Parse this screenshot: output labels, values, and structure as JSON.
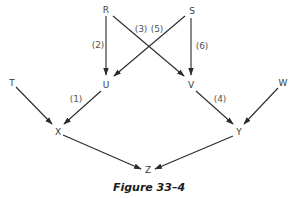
{
  "figure": {
    "caption": "Figure 33–4"
  },
  "nodes": [
    {
      "id": "R",
      "label": "R",
      "x": 106,
      "y": 13
    },
    {
      "id": "S",
      "label": "S",
      "x": 191,
      "y": 13
    },
    {
      "id": "U",
      "label": "U",
      "x": 106,
      "y": 86
    },
    {
      "id": "V",
      "label": "V",
      "x": 191,
      "y": 86
    },
    {
      "id": "T",
      "label": "T",
      "x": 12,
      "y": 86
    },
    {
      "id": "W",
      "label": "W",
      "x": 282,
      "y": 86
    },
    {
      "id": "X",
      "label": "X",
      "x": 58,
      "y": 135
    },
    {
      "id": "Y",
      "label": "Y",
      "x": 239,
      "y": 135
    },
    {
      "id": "Z",
      "label": "Z",
      "x": 148,
      "y": 172
    }
  ],
  "edges": [
    {
      "from": "R",
      "to": "U",
      "label": "(2)"
    },
    {
      "from": "R",
      "to": "V",
      "label": "(3)"
    },
    {
      "from": "S",
      "to": "U",
      "label": "(5)"
    },
    {
      "from": "S",
      "to": "V",
      "label": "(6)"
    },
    {
      "from": "T",
      "to": "X",
      "label": ""
    },
    {
      "from": "U",
      "to": "X",
      "label": "(1)"
    },
    {
      "from": "V",
      "to": "Y",
      "label": "(4)"
    },
    {
      "from": "W",
      "to": "Y",
      "label": ""
    },
    {
      "from": "X",
      "to": "Z",
      "label": ""
    },
    {
      "from": "Y",
      "to": "Z",
      "label": ""
    }
  ],
  "edge_labels": {
    "e1": "(1)",
    "e2": "(2)",
    "e3": "(3)",
    "e4": "(4)",
    "e5": "(5)",
    "e6": "(6)"
  }
}
